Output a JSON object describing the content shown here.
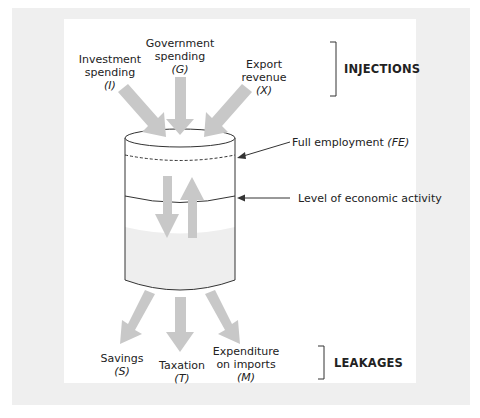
{
  "diagram": {
    "type": "circular-flow-tank",
    "colors": {
      "background_panel": "#efefef",
      "card": "#ffffff",
      "arrow_fill": "#c8c8c8",
      "tank_fill": "#eeeeee",
      "outline": "#333333",
      "text": "#222222"
    },
    "injections": {
      "group_label": "INJECTIONS",
      "items": [
        {
          "name": "Investment spending",
          "line1": "Investment",
          "line2": "spending",
          "symbol": "(I)"
        },
        {
          "name": "Government spending",
          "line1": "Government",
          "line2": "spending",
          "symbol": "(G)"
        },
        {
          "name": "Export revenue",
          "line1": "Export",
          "line2": "revenue",
          "symbol": "(X)"
        }
      ]
    },
    "tank": {
      "full_employment_label": "Full employment",
      "full_employment_symbol": "(FE)",
      "activity_label": "Level of economic activity"
    },
    "leakages": {
      "group_label": "LEAKAGES",
      "items": [
        {
          "name": "Savings",
          "line1": "Savings",
          "symbol": "(S)"
        },
        {
          "name": "Taxation",
          "line1": "Taxation",
          "symbol": "(T)"
        },
        {
          "name": "Expenditure on imports",
          "line1": "Expenditure",
          "line2": "on imports",
          "symbol": "(M)"
        }
      ]
    }
  }
}
